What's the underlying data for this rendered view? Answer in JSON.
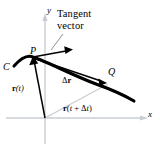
{
  "figure": {
    "background_color": "#ffffff",
    "ink_color": "#000000",
    "axis_color": "#c9cdd2",
    "secondary_vector_color": "#c9cdd2",
    "width": 160,
    "height": 150,
    "annotations": {
      "tangent_vector_line1": "Tangent",
      "tangent_vector_line2": "vector"
    },
    "axes": {
      "y_label": "y",
      "x_label": "x"
    },
    "points": {
      "P": "P",
      "Q": "Q",
      "curve": "C"
    },
    "vectors": {
      "r_of_t_bold": "r",
      "r_of_t_arg": "(t)",
      "delta_r_symbol": "Δ",
      "delta_r_bold": "r",
      "r_of_t_plus_dt_bold": "r",
      "r_of_t_plus_dt_open": "(",
      "r_of_t_plus_dt_t": "t",
      "r_of_t_plus_dt_plus": " + ",
      "r_of_t_plus_dt_delta": "Δ",
      "r_of_t_plus_dt_t2": "t",
      "r_of_t_plus_dt_close": ")"
    }
  }
}
